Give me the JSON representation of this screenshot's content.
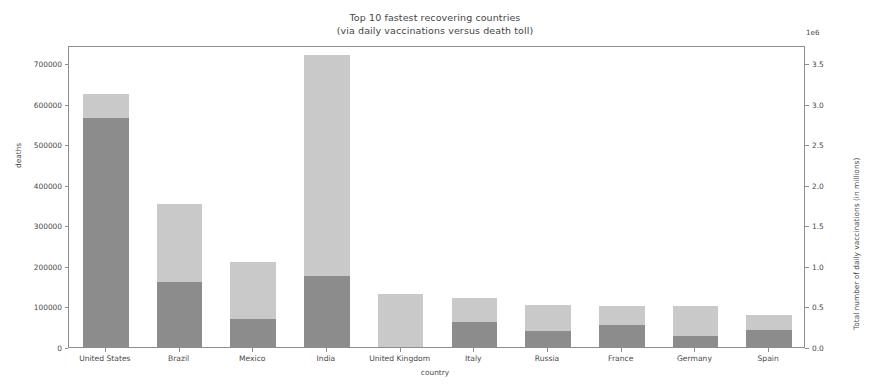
{
  "figure": {
    "title_line1": "Top 10 fastest recovering countries",
    "title_line2": "(via daily vaccinations versus death toll)",
    "offset_text": "1e6",
    "background": "#ffffff",
    "frame_color": "#8e8e8e"
  },
  "colors": {
    "vaccinations_bar": "#c9c9c9",
    "deaths_bar": "#8c8c8c",
    "text": "#4a4a4a"
  },
  "chart_data": {
    "type": "bar",
    "title": "Top 10 fastest recovering countries\n(via daily vaccinations versus death toll)",
    "xlabel": "country",
    "ylabel": "deaths",
    "ylabel_right": "Total number of daily vaccinations (in millions)",
    "grid": false,
    "legend": "none",
    "bar_mode": "overlaid",
    "categories": [
      "United States",
      "Brazil",
      "Mexico",
      "India",
      "United Kingdom",
      "Italy",
      "Russia",
      "France",
      "Germany",
      "Spain"
    ],
    "series": [
      {
        "name": "Total number of daily vaccinations (in millions)",
        "axis": "right",
        "color": "#c9c9c9",
        "units": "deaths-equivalent height",
        "values": [
          625000,
          352000,
          210000,
          720000,
          130000,
          120000,
          103000,
          102000,
          100000,
          78000
        ],
        "values_right_axis": [
          3.125,
          1.76,
          1.05,
          3.6,
          0.65,
          0.6,
          0.515,
          0.51,
          0.5,
          0.39
        ]
      },
      {
        "name": "deaths",
        "axis": "left",
        "color": "#8c8c8c",
        "values": [
          565000,
          160000,
          70000,
          175000,
          0,
          62000,
          40000,
          55000,
          28000,
          42000
        ]
      }
    ],
    "ylim": [
      0,
      745000
    ],
    "ylim_right": [
      0,
      3.725
    ],
    "yticks": [
      0,
      100000,
      200000,
      300000,
      400000,
      500000,
      600000,
      700000
    ],
    "ytick_labels": [
      "0",
      "100000",
      "200000",
      "300000",
      "400000",
      "500000",
      "600000",
      "700000"
    ],
    "yticks_right": [
      0.0,
      0.5,
      1.0,
      1.5,
      2.0,
      2.5,
      3.0,
      3.5
    ],
    "ytick_labels_right": [
      "0.0",
      "0.5",
      "1.0",
      "1.5",
      "2.0",
      "2.5",
      "3.0",
      "3.5"
    ],
    "right_axis_offset": "1e6"
  }
}
